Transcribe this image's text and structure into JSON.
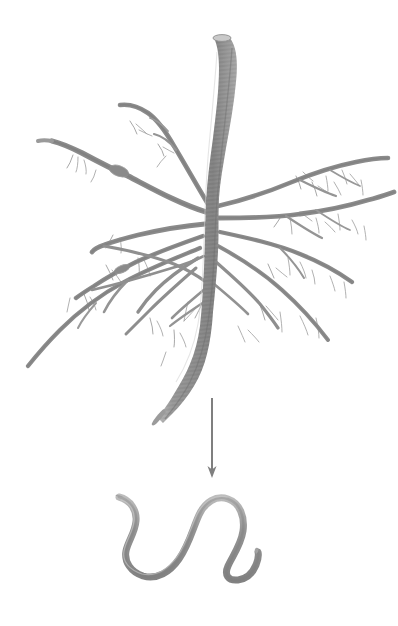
{
  "figure": {
    "title": "Plant root system with nematode",
    "background_color": "#ffffff",
    "width": 398,
    "height": 626,
    "style": "grayscale pencil / scanned botanical illustration"
  },
  "palette": {
    "background": "#ffffff",
    "root_main": "#8d8d8d",
    "root_dark": "#6f6f6f",
    "root_light": "#b4b4b4",
    "root_hair": "#9a9a9a",
    "arrow": "#7f7f7f",
    "worm_body": "#9a9a9a",
    "worm_shade": "#7d7d7d",
    "worm_light": "#c2c2c2"
  },
  "elements": {
    "root_system": {
      "label": "root-system",
      "description": "Thick vertical tap root with many lateral roots and fine root hairs",
      "taproot_top_y": 36,
      "taproot_bottom_y": 424,
      "crown_center_x": 212,
      "crown_center_y": 225,
      "lateral_root_count": 14,
      "root_hair_count": 34
    },
    "arrow": {
      "label": "downward-arrow",
      "direction": "down",
      "x": 212,
      "y_start": 398,
      "y_end": 478,
      "head_width": 9,
      "head_length": 12,
      "stroke_width": 2,
      "color": "#7f7f7f"
    },
    "nematode": {
      "label": "nematode-worm",
      "description": "Sinusoidal S-shaped roundworm with tapered hooked ends",
      "bbox": {
        "x": 116,
        "y": 494,
        "width": 146,
        "height": 88
      },
      "body_max_thickness": 7,
      "color": "#9a9a9a"
    }
  },
  "annotations": {
    "figure_caption": "",
    "labels": []
  },
  "chart_data": {
    "type": "diagram",
    "title": "Plant root system with nematode",
    "nodes": [
      {
        "id": "root-system",
        "label": "Root system",
        "x": 200,
        "y": 230
      },
      {
        "id": "nematode",
        "label": "Nematode",
        "x": 189,
        "y": 538
      }
    ],
    "edges": [
      {
        "from": "root-system",
        "to": "nematode",
        "type": "arrow",
        "label": ""
      }
    ]
  }
}
